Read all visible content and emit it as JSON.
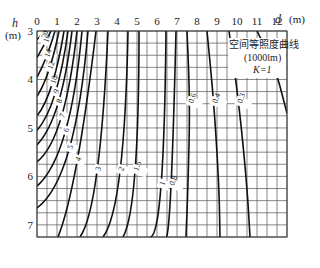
{
  "chart_data": {
    "type": "line",
    "title": "空间等照度曲线",
    "subtitle": "(1000lm)",
    "annotation": "K=1",
    "xlabel": "d",
    "xunit": "(m)",
    "ylabel": "h",
    "yunit": "(m)",
    "x_ticks": [
      "0",
      "1",
      "2",
      "3",
      "4",
      "5",
      "6",
      "7",
      "8",
      "9",
      "10",
      "11",
      "12"
    ],
    "y_ticks": [
      "3",
      "4",
      "5",
      "6",
      "7"
    ],
    "xlim": [
      0,
      12.5
    ],
    "ylim": [
      3,
      7.25
    ],
    "y_inverted": true,
    "grid": true,
    "grid_step_x": 0.5,
    "grid_step_y": 0.25,
    "series": [
      {
        "name": "20",
        "points": [
          [
            0.0,
            3.18
          ],
          [
            0.3,
            3.05
          ],
          [
            0.45,
            3.0
          ]
        ]
      },
      {
        "name": "16",
        "points": [
          [
            0.0,
            3.55
          ],
          [
            0.4,
            3.25
          ],
          [
            0.7,
            3.0
          ]
        ]
      },
      {
        "name": "14",
        "points": [
          [
            0.0,
            3.95
          ],
          [
            0.45,
            3.55
          ],
          [
            0.9,
            3.0
          ]
        ]
      },
      {
        "name": "12",
        "points": [
          [
            0.0,
            4.35
          ],
          [
            0.6,
            3.8
          ],
          [
            1.1,
            3.0
          ]
        ]
      },
      {
        "name": "10",
        "points": [
          [
            0.0,
            4.75
          ],
          [
            0.75,
            4.1
          ],
          [
            1.35,
            3.0
          ]
        ]
      },
      {
        "name": "9",
        "points": [
          [
            0.0,
            5.05
          ],
          [
            0.9,
            4.3
          ],
          [
            1.55,
            3.0
          ]
        ]
      },
      {
        "name": "8",
        "points": [
          [
            0.0,
            5.35
          ],
          [
            1.05,
            4.5
          ],
          [
            1.75,
            3.0
          ]
        ]
      },
      {
        "name": "7",
        "points": [
          [
            0.0,
            5.7
          ],
          [
            1.2,
            4.8
          ],
          [
            2.0,
            3.0
          ]
        ]
      },
      {
        "name": "6",
        "points": [
          [
            0.0,
            6.2
          ],
          [
            1.4,
            5.1
          ],
          [
            2.25,
            3.0
          ]
        ]
      },
      {
        "name": "5",
        "points": [
          [
            0.0,
            6.65
          ],
          [
            1.6,
            5.45
          ],
          [
            2.55,
            3.0
          ]
        ]
      },
      {
        "name": "4",
        "points": [
          [
            1.05,
            7.25
          ],
          [
            2.0,
            5.7
          ],
          [
            2.95,
            3.0
          ]
        ]
      },
      {
        "name": "3",
        "points": [
          [
            2.15,
            7.25
          ],
          [
            3.0,
            5.9
          ],
          [
            3.55,
            3.0
          ]
        ]
      },
      {
        "name": "2",
        "points": [
          [
            3.3,
            7.25
          ],
          [
            4.15,
            5.9
          ],
          [
            4.55,
            3.0
          ]
        ]
      },
      {
        "name": "1.5",
        "points": [
          [
            4.3,
            7.25
          ],
          [
            4.9,
            5.9
          ],
          [
            5.1,
            3.0
          ]
        ]
      },
      {
        "name": "1",
        "points": [
          [
            5.65,
            7.25
          ],
          [
            6.2,
            6.2
          ],
          [
            6.45,
            3.0
          ]
        ]
      },
      {
        "name": "0.8",
        "points": [
          [
            6.45,
            7.25
          ],
          [
            6.7,
            6.2
          ],
          [
            6.95,
            3.0
          ]
        ]
      },
      {
        "name": "0.6",
        "points": [
          [
            7.45,
            7.25
          ],
          [
            7.55,
            6.2
          ],
          [
            7.65,
            4.5
          ],
          [
            7.5,
            3.0
          ]
        ]
      },
      {
        "name": "0.4",
        "points": [
          [
            9.15,
            7.25
          ],
          [
            9.1,
            6.2
          ],
          [
            8.85,
            4.5
          ],
          [
            8.5,
            3.0
          ]
        ]
      },
      {
        "name": "0.3",
        "points": [
          [
            10.65,
            7.25
          ],
          [
            10.5,
            6.2
          ],
          [
            10.1,
            4.5
          ],
          [
            9.6,
            3.0
          ]
        ]
      },
      {
        "name": "0.2",
        "points": [
          [
            12.5,
            4.7
          ],
          [
            12.0,
            3.9
          ],
          [
            11.6,
            3.5
          ],
          [
            11.0,
            3.0
          ]
        ]
      }
    ]
  }
}
